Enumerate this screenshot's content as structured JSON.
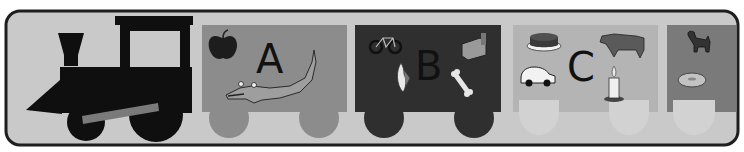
{
  "colors": {
    "panel_bg": "#c9c9c9",
    "panel_border": "#1e1e1e",
    "engine": "#0f0f0f",
    "engine_window": "#c9c9c9",
    "engine_rod": "#7a7a7a",
    "car_a": "#8c8c8c",
    "car_b": "#2f2f2f",
    "car_c": "#b4b4b4",
    "car_d": "#7a7a7a",
    "light_wheel": "#d2d2d2"
  },
  "engine": {
    "label": "locomotive"
  },
  "cars": [
    {
      "letter": "A",
      "pictures": [
        "apple",
        "alligator"
      ]
    },
    {
      "letter": "B",
      "pictures": [
        "bicycle",
        "bed",
        "banana",
        "bone"
      ]
    },
    {
      "letter": "C",
      "pictures": [
        "cake",
        "cow",
        "car",
        "candle"
      ]
    },
    {
      "letter": "",
      "pictures": [
        "dog",
        "donut"
      ]
    }
  ]
}
